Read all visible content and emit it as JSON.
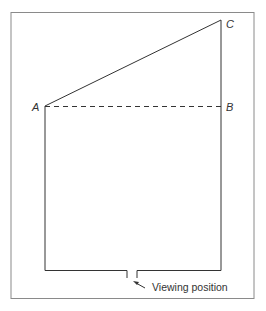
{
  "diagram": {
    "type": "plan-view",
    "points": {
      "A": {
        "label": "A",
        "x": 45,
        "y": 106
      },
      "B": {
        "label": "B",
        "x": 221,
        "y": 106
      },
      "C": {
        "label": "C",
        "x": 221,
        "y": 20
      }
    },
    "caption": "Viewing position",
    "colors": {
      "line": "#333333",
      "frame": "#888888",
      "background": "#ffffff"
    },
    "lines": [
      {
        "from": "A",
        "to": "C",
        "style": "solid"
      },
      {
        "from": "A",
        "to": "B",
        "style": "dashed"
      }
    ]
  }
}
